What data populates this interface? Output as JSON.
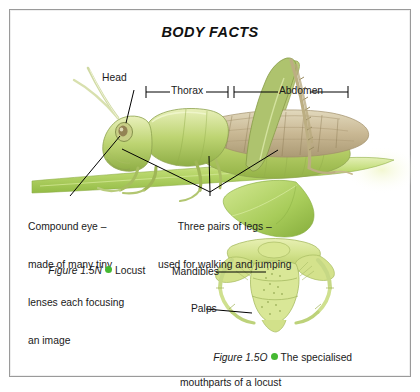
{
  "panel": {
    "title": "BODY FACTS",
    "border_color": "#9a9a9a",
    "background": "#ffffff"
  },
  "accent": {
    "bullet_color": "#45b832",
    "locust_green": "#a9c94f",
    "wing_tan": "#c7b48a"
  },
  "figure_locust": {
    "labels": {
      "head": "Head",
      "thorax": "Thorax",
      "abdomen": "Abdomen",
      "compound_eye_l1": "Compound eye –",
      "compound_eye_l2": "made of many tiny",
      "compound_eye_l3": "lenses each focusing",
      "compound_eye_l4": "an image",
      "legs_l1": "Three pairs of legs –",
      "legs_l2": "used for walking and jumping"
    },
    "caption": {
      "number": "Figure 1.5N",
      "text": "Locust"
    }
  },
  "figure_mouthparts": {
    "labels": {
      "mandibles": "Mandibles",
      "palps": "Palps"
    },
    "caption": {
      "number": "Figure 1.5O",
      "text_l1": "The specialised",
      "text_l2": "mouthparts of a locust"
    }
  }
}
